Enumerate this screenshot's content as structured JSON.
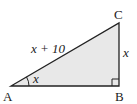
{
  "diagram": {
    "type": "right-triangle",
    "fill_color": "#e8e8e8",
    "stroke_color": "#222222",
    "vertices": [
      {
        "label": "A"
      },
      {
        "label": "B"
      },
      {
        "label": "C"
      }
    ],
    "sides": {
      "hypotenuse_AC": "x + 10",
      "side_BC": "x"
    },
    "angle_A": "x",
    "right_angle_at": "B"
  }
}
